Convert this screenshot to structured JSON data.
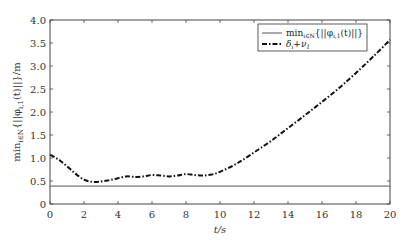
{
  "chart_data": {
    "type": "line",
    "title": "",
    "xlabel": "t/s",
    "ylabel": "min_{i∈N}{||φ_{i,1}(t)||}/m",
    "xlim": [
      0,
      20
    ],
    "ylim": [
      0,
      4.0
    ],
    "xticks": [
      0,
      2,
      4,
      6,
      8,
      10,
      12,
      14,
      16,
      18,
      20
    ],
    "xtick_labels": [
      "0",
      "2",
      "4",
      "6",
      "8",
      "10",
      "12",
      "14",
      "16",
      "18",
      "20"
    ],
    "yticks": [
      0,
      0.5,
      1.0,
      1.5,
      2.0,
      2.5,
      3.0,
      3.5,
      4.0
    ],
    "ytick_labels": [
      "0",
      "0.5",
      "1.0",
      "1.5",
      "2.0",
      "2.5",
      "3.0",
      "3.5",
      "4.0"
    ],
    "grid": false,
    "legend_position": "upper right",
    "series": [
      {
        "name": "min_{i∈N}{||φ_{i,1}(t)||}",
        "style": "solid",
        "color": "#555555",
        "x": [
          0,
          20
        ],
        "y": [
          0.39,
          0.39
        ]
      },
      {
        "name": "δ_i+ν_1",
        "style": "dash-dot",
        "color": "#111111",
        "x": [
          0,
          0.5,
          1,
          1.5,
          2,
          2.5,
          3,
          3.5,
          4,
          4.5,
          5,
          5.5,
          6,
          6.5,
          7,
          7.5,
          8,
          8.5,
          9,
          9.5,
          10,
          11,
          12,
          13,
          14,
          15,
          16,
          17,
          18,
          19,
          20
        ],
        "y": [
          1.07,
          0.97,
          0.82,
          0.66,
          0.53,
          0.48,
          0.49,
          0.52,
          0.56,
          0.6,
          0.59,
          0.6,
          0.63,
          0.62,
          0.6,
          0.62,
          0.65,
          0.63,
          0.62,
          0.64,
          0.7,
          0.88,
          1.12,
          1.37,
          1.65,
          1.93,
          2.22,
          2.52,
          2.85,
          3.2,
          3.57
        ]
      }
    ]
  },
  "legend": {
    "entries": [
      {
        "label": "min",
        "sub": "i∈N",
        "rest": "{||φ",
        "sub2": "i,1",
        "tail": "(t)||}"
      },
      {
        "label": "δ",
        "sub": "i",
        "rest": "+ν",
        "sub2": "1",
        "tail": ""
      }
    ]
  },
  "axes": {
    "xlabel_text": "t/s",
    "ylabel_main": "min",
    "ylabel_sub": "i∈N",
    "ylabel_rest": "{||φ",
    "ylabel_sub2": "i,1",
    "ylabel_tail": "(t)||}/m"
  },
  "colors": {
    "axis": "#444444",
    "threshold_line": "#555555",
    "bound_line": "#111111"
  }
}
